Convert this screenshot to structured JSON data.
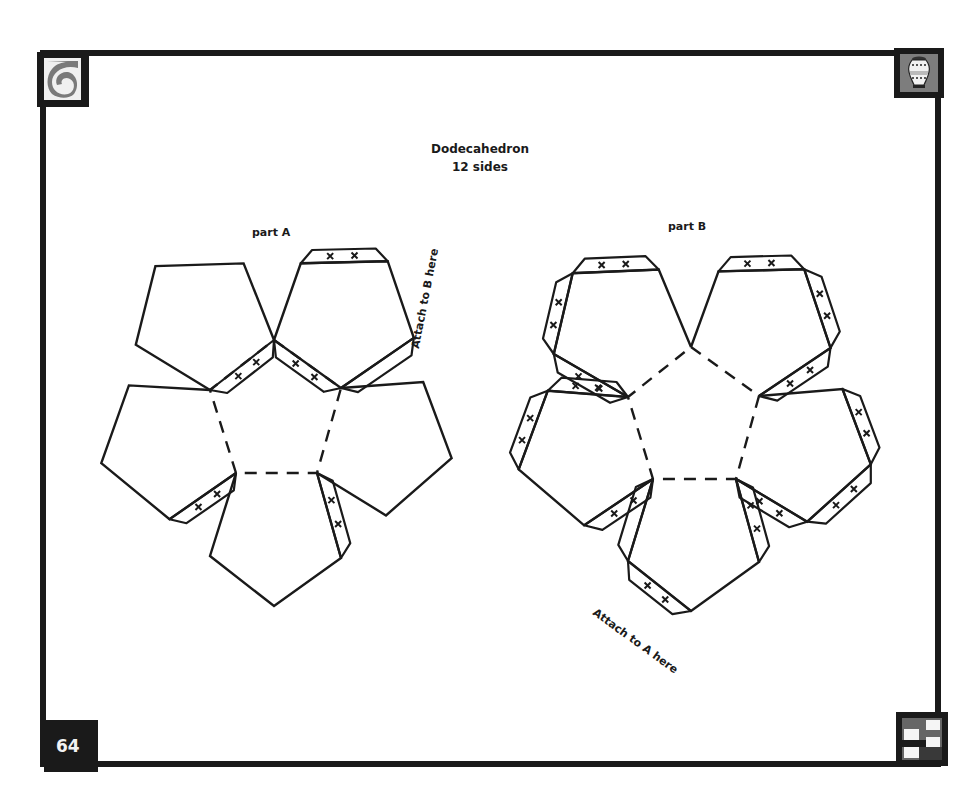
{
  "title": "Dodecahedron",
  "subtitle": "12 sides",
  "part_a_label": "part A",
  "part_b_label": "part B",
  "attach_a_note": "Attach to B here",
  "attach_b_note": "Attach to A here",
  "page_number": "64",
  "tab_mark": "x",
  "icons": {
    "top_left": "spiral-icon",
    "top_right": "vase-icon",
    "bottom_right": "grid-pattern-icon"
  },
  "colors": {
    "ink": "#1a1a1a",
    "corner_gray": "#7d7d7d"
  }
}
